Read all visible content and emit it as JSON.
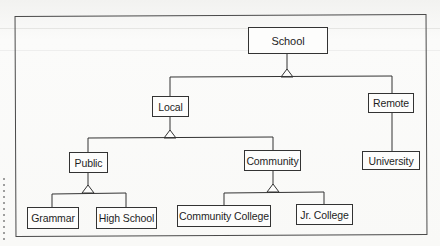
{
  "diagram": {
    "type": "hierarchy",
    "nodes": {
      "school": "School",
      "local": "Local",
      "remote": "Remote",
      "public": "Public",
      "community": "Community",
      "university": "University",
      "grammar": "Grammar",
      "high_school": "High School",
      "community_college": "Community College",
      "jr_college": "Jr. College"
    },
    "edges": [
      {
        "from": "School",
        "to": [
          "Local",
          "Remote"
        ],
        "notation": "subtype-triangle"
      },
      {
        "from": "Local",
        "to": [
          "Public",
          "Community"
        ],
        "notation": "subtype-triangle"
      },
      {
        "from": "Remote",
        "to": [
          "University"
        ],
        "notation": "line"
      },
      {
        "from": "Public",
        "to": [
          "Grammar",
          "High School"
        ],
        "notation": "subtype-triangle"
      },
      {
        "from": "Community",
        "to": [
          "Community College",
          "Jr. College"
        ],
        "notation": "subtype-triangle"
      }
    ],
    "colors": {
      "line": "#333333",
      "box_border": "#333333",
      "text": "#1e1e1e",
      "background": "#f9f9f7"
    }
  }
}
